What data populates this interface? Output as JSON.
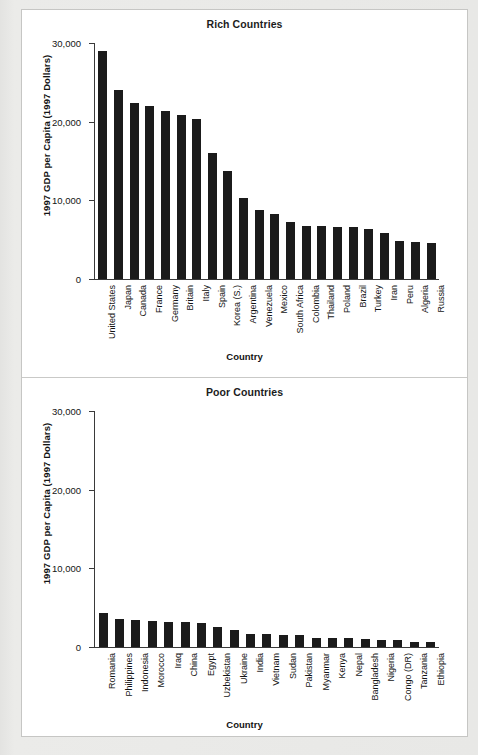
{
  "figure": {
    "background_color": "#ffffff",
    "bar_color": "#1b1b1b",
    "axis_color": "#3a3a3a"
  },
  "chart_data": [
    {
      "type": "bar",
      "title": "Rich Countries",
      "xlabel": "Country",
      "ylabel": "1997 GDP per Capita (1997 Dollars)",
      "ylim": [
        0,
        30000
      ],
      "yticks": [
        0,
        10000,
        20000,
        30000
      ],
      "ytick_labels": [
        "0",
        "10,000",
        "20,000",
        "30,000"
      ],
      "grid": false,
      "legend": "none",
      "categories": [
        "United States",
        "Japan",
        "Canada",
        "France",
        "Germany",
        "Britain",
        "Italy",
        "Spain",
        "Korea (S.)",
        "Argentina",
        "Venezuela",
        "Mexico",
        "South Africa",
        "Colombia",
        "Thailand",
        "Poland",
        "Brazil",
        "Turkey",
        "Iran",
        "Peru",
        "Algeria",
        "Russia"
      ],
      "values": [
        29000,
        24000,
        22400,
        22000,
        21300,
        20800,
        20300,
        16000,
        13700,
        10300,
        8800,
        8300,
        7300,
        6800,
        6800,
        6600,
        6600,
        6400,
        5900,
        4800,
        4700,
        4600
      ]
    },
    {
      "type": "bar",
      "title": "Poor Countries",
      "xlabel": "Country",
      "ylabel": "1997 GDP per Capita (1997 Dollars)",
      "ylim": [
        0,
        30000
      ],
      "yticks": [
        0,
        10000,
        20000,
        30000
      ],
      "ytick_labels": [
        "0",
        "10,000",
        "20,000",
        "30,000"
      ],
      "grid": false,
      "legend": "none",
      "categories": [
        "Romania",
        "Philippines",
        "Indonesia",
        "Morocco",
        "Iraq",
        "China",
        "Egypt",
        "Uzbekistan",
        "Ukraine",
        "India",
        "Vietnam",
        "Sudan",
        "Pakistan",
        "Myanmar",
        "Kenya",
        "Nepal",
        "Bangladesh",
        "Nigeria",
        "Congo (DR)",
        "Tanzania",
        "Ethiopia"
      ],
      "values": [
        4300,
        3500,
        3450,
        3300,
        3200,
        3150,
        3050,
        2500,
        2150,
        1700,
        1700,
        1550,
        1550,
        1150,
        1200,
        1150,
        1050,
        950,
        950,
        700,
        600
      ]
    }
  ]
}
